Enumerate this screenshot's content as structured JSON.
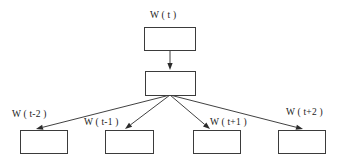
{
  "figure": {
    "type": "node-link-diagram",
    "background_color": "#ffffff",
    "line_color": "#2b2b2b",
    "box_stroke_color": "#3b3b3b",
    "box_fill_color": "#ffffff",
    "text_color": "#1a1a1a"
  },
  "nodes": {
    "input": {
      "label": "W ( t )",
      "label_x": 150,
      "label_y": 11,
      "box_x": 144,
      "box_y": 27,
      "box_w": 51,
      "box_h": 23
    },
    "projection": {
      "label": "",
      "box_x": 145,
      "box_y": 71,
      "box_w": 50,
      "box_h": 24
    },
    "outputs": [
      {
        "label": "W ( t-2 )",
        "label_x": 12,
        "label_y": 110,
        "box_x": 20,
        "box_y": 130,
        "box_w": 47,
        "box_h": 23,
        "arrow_target_x": 36,
        "arrow_target_y": 129
      },
      {
        "label": "W ( t-1 )",
        "label_x": 84,
        "label_y": 118,
        "box_x": 105,
        "box_y": 130,
        "box_w": 48,
        "box_h": 23,
        "arrow_target_x": 125,
        "arrow_target_y": 129
      },
      {
        "label": "W ( t+1 )",
        "label_x": 210,
        "label_y": 118,
        "box_x": 193,
        "box_y": 130,
        "box_w": 47,
        "box_h": 23,
        "arrow_target_x": 210,
        "arrow_target_y": 129
      },
      {
        "label": "W ( t+2 )",
        "label_x": 286,
        "label_y": 108,
        "box_x": 278,
        "box_y": 130,
        "box_w": 47,
        "box_h": 23,
        "arrow_target_x": 303,
        "arrow_target_y": 129
      }
    ]
  },
  "edges": {
    "input_to_projection": {
      "from_x": 170,
      "from_y": 50,
      "to_x": 170,
      "to_y": 70
    },
    "fanout_origin": {
      "x": 170,
      "y": 95
    }
  }
}
